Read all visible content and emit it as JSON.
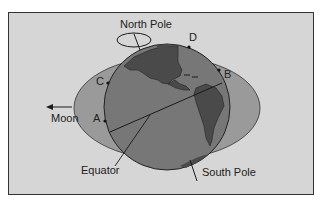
{
  "diagram": {
    "type": "tidal-bulges",
    "labels": {
      "north_pole": "North Pole",
      "south_pole": "South Pole",
      "equator": "Equator",
      "moon": "Moon",
      "point_a": "A",
      "point_b": "B",
      "point_c": "C",
      "point_d": "D"
    },
    "colors": {
      "background": "#d6d6d6",
      "bulge": "#9a9a9a",
      "earth_ocean": "#777777",
      "continents": "#4a4a4a",
      "lines": "#1a1a1a"
    }
  }
}
